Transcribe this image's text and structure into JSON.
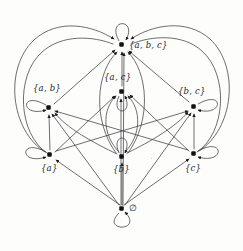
{
  "figure": {
    "background_color": "#fdfdfc",
    "edge_color": "#3d3d42",
    "node_color": "#111114",
    "label_color": "#26262a",
    "width": 243,
    "height": 251
  },
  "nodes": [
    {
      "id": "abc",
      "label": "{a, b, c}",
      "x": 122,
      "y": 45,
      "label_x": 129,
      "label_y": 40,
      "label_align": "right-of-node"
    },
    {
      "id": "ab",
      "label": "{a, b}",
      "x": 49,
      "y": 108,
      "label_x": 33,
      "label_y": 83,
      "label_align": "above-node"
    },
    {
      "id": "ac",
      "label": "{a, c}",
      "x": 122,
      "y": 92,
      "label_x": 104,
      "label_y": 72,
      "label_align": "above-node"
    },
    {
      "id": "bc",
      "label": "{b, c}",
      "x": 194,
      "y": 107,
      "label_x": 178,
      "label_y": 86,
      "label_align": "above-node"
    },
    {
      "id": "a",
      "label": "{a}",
      "x": 50,
      "y": 155,
      "label_x": 41,
      "label_y": 163,
      "label_align": "below-node"
    },
    {
      "id": "b",
      "label": "{b}",
      "x": 122,
      "y": 157,
      "label_x": 113,
      "label_y": 164,
      "label_align": "below-node"
    },
    {
      "id": "c",
      "label": "{c}",
      "x": 194,
      "y": 154,
      "label_x": 185,
      "label_y": 163,
      "label_align": "below-node"
    },
    {
      "id": "empty",
      "label": "∅",
      "x": 122,
      "y": 209,
      "label_x": 129,
      "label_y": 203,
      "label_align": "right-of-node"
    }
  ],
  "self_loops": [
    {
      "node": "abc",
      "direction": "up",
      "description": "reflexive loop above {a, b, c}"
    },
    {
      "node": "ab",
      "direction": "left",
      "description": "reflexive loop left of {a, b}"
    },
    {
      "node": "ac",
      "direction": "down",
      "description": "reflexive loop below {a, c}"
    },
    {
      "node": "bc",
      "direction": "right",
      "description": "reflexive loop right of {b, c}"
    },
    {
      "node": "a",
      "direction": "left",
      "description": "reflexive loop left of {a}"
    },
    {
      "node": "b",
      "direction": "up",
      "description": "reflexive loop above {b}"
    },
    {
      "node": "c",
      "direction": "right",
      "description": "reflexive loop right of {c}"
    },
    {
      "node": "empty",
      "direction": "down",
      "description": "reflexive loop below ∅"
    }
  ],
  "edges": [
    {
      "from": "a",
      "to": "ab",
      "style": "straight"
    },
    {
      "from": "a",
      "to": "ac",
      "style": "straight"
    },
    {
      "from": "a",
      "to": "abc",
      "style": "curve-outer-left"
    },
    {
      "from": "b",
      "to": "ab",
      "style": "curve"
    },
    {
      "from": "b",
      "to": "bc",
      "style": "curve"
    },
    {
      "from": "b",
      "to": "ac",
      "style": "curve-inner"
    },
    {
      "from": "b",
      "to": "abc",
      "style": "curve-inner"
    },
    {
      "from": "c",
      "to": "bc",
      "style": "straight"
    },
    {
      "from": "c",
      "to": "ac",
      "style": "straight"
    },
    {
      "from": "c",
      "to": "abc",
      "style": "curve-outer-right"
    },
    {
      "from": "ab",
      "to": "abc",
      "style": "straight"
    },
    {
      "from": "ac",
      "to": "abc",
      "style": "straight"
    },
    {
      "from": "bc",
      "to": "abc",
      "style": "straight"
    },
    {
      "from": "empty",
      "to": "a",
      "style": "straight"
    },
    {
      "from": "empty",
      "to": "b",
      "style": "straight"
    },
    {
      "from": "empty",
      "to": "c",
      "style": "straight"
    },
    {
      "from": "empty",
      "to": "ab",
      "style": "straight"
    },
    {
      "from": "empty",
      "to": "ac",
      "style": "straight"
    },
    {
      "from": "empty",
      "to": "bc",
      "style": "straight"
    },
    {
      "from": "empty",
      "to": "abc",
      "style": "straight"
    }
  ],
  "specks": [
    {
      "x": 151,
      "y": 158,
      "size": 1.4
    },
    {
      "x": 156,
      "y": 182,
      "size": 1.2
    }
  ]
}
